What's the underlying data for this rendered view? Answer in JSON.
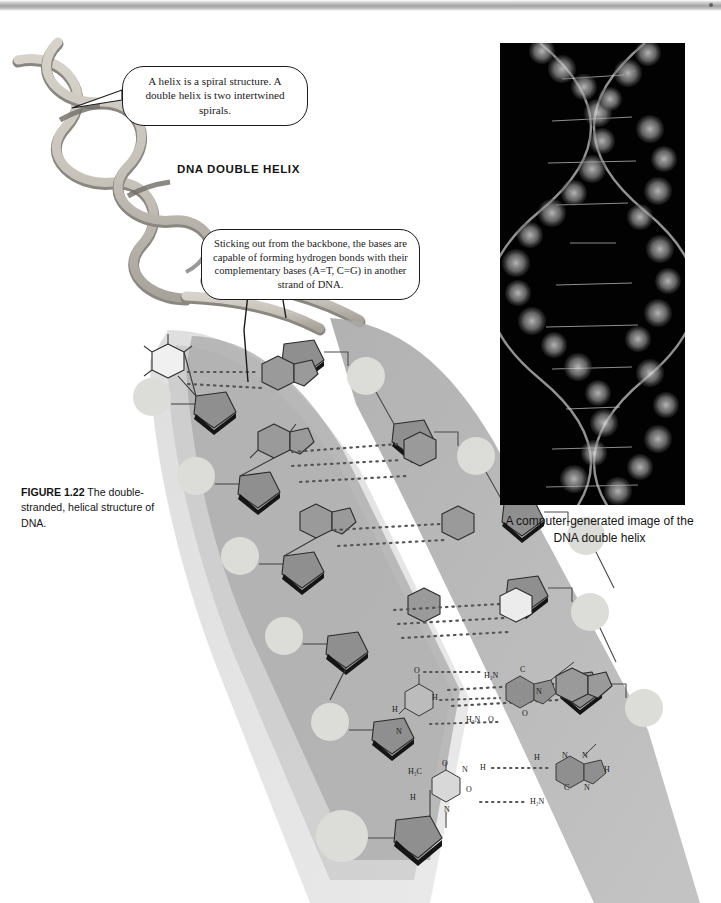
{
  "figure": {
    "title": "DNA DOUBLE HELIX",
    "caption_lead": "FIGURE 1.22",
    "caption_text": "The double-stranded, helical structure of DNA."
  },
  "callouts": [
    {
      "id": "helix",
      "text": "A helix is a spiral structure. A double helix is two intertwined spirals."
    },
    {
      "id": "bases",
      "text": "Sticking out from the backbone, the bases are capable of forming hydrogen bonds with their complementary bases (A=T, C=G) in another strand of DNA."
    }
  ],
  "photo_panel": {
    "caption": "A computer-generated image of the DNA double helix"
  },
  "base_pairs": {
    "cg": {
      "labels": [
        "O",
        "H₂N",
        "H",
        "N",
        "H₂N",
        "O"
      ],
      "bond_count": 3,
      "pair": "C=G"
    },
    "ta": {
      "labels": [
        "H₃C",
        "O",
        "C",
        "N",
        "H",
        "N",
        "C",
        "N",
        "H",
        "H₂N",
        "O"
      ],
      "bond_count": 2,
      "pair": "A=T"
    }
  },
  "colors": {
    "ribbon_light": "#c9c4bb",
    "ribbon_dark": "#7d7a74",
    "backbone_band": "#a9a9a9",
    "backbone_band_faint": "#d8d8d8",
    "sugar": "#8f8f8f",
    "phosphate": "#dcdcd8",
    "base_purine": "#9a9a9a",
    "base_pyrimidine": "#ececec",
    "outline": "#2b2b2b",
    "panel_background": "#020202",
    "page_background": "#ffffff"
  }
}
